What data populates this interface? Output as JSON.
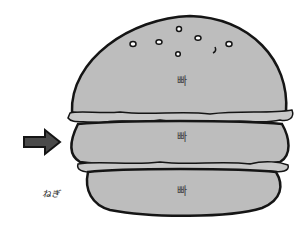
{
  "illustration": {
    "subject": "stacked burger of three buns",
    "colors": {
      "bun": "#bdbdbd",
      "outline": "#151515",
      "lettuce": "#c8c8c8",
      "arrow": "#4a4a4a",
      "background": "#ffffff"
    },
    "layers": [
      {
        "name": "top-bun",
        "label": "빠"
      },
      {
        "name": "middle-bun",
        "label": "빠"
      },
      {
        "name": "bottom-bun",
        "label": "빠"
      }
    ],
    "arrow": {
      "icon": "right-arrow-icon"
    },
    "signature": "ねぎ"
  }
}
